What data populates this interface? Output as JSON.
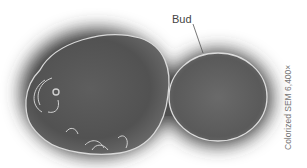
{
  "figure": {
    "labels": {
      "bud": "Bud"
    },
    "caption": "Colorized SEM 6,400×",
    "colors": {
      "background": "#ffffff",
      "cell_body": "#555555",
      "cell_rim": "#d8d8d8",
      "shadow": "#3a3a3a",
      "label_text": "#444444",
      "caption_text": "#777777"
    }
  }
}
